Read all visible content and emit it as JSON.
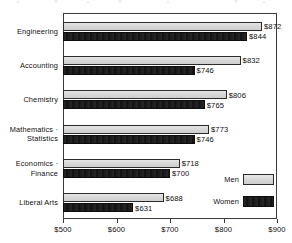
{
  "chart_data": {
    "type": "bar",
    "orientation": "horizontal",
    "title": "",
    "subtitle": "",
    "xlabel": "",
    "ylabel": "",
    "xlim": [
      500,
      900
    ],
    "xticks": [
      500,
      600,
      700,
      800,
      900
    ],
    "xtick_labels": [
      "$500",
      "$600",
      "$700",
      "$800",
      "$900"
    ],
    "grid": false,
    "legend_position": "inside-bottom-right",
    "categories": [
      "Engineering",
      "Accounting",
      "Chemistry",
      "Mathematics ·\nStatistics",
      "Economics ·\nFinance",
      "Liberal Arts"
    ],
    "series": [
      {
        "name": "Men",
        "color": "#d7d7d7",
        "values": [
          872,
          832,
          806,
          773,
          718,
          688
        ],
        "value_labels": [
          "$872",
          "$832",
          "$806",
          "$773",
          "$718",
          "$688"
        ]
      },
      {
        "name": "Women",
        "color": "#161616",
        "values": [
          844,
          746,
          765,
          746,
          700,
          631
        ],
        "value_labels": [
          "$844",
          "$746",
          "$765",
          "$746",
          "$700",
          "$631"
        ]
      }
    ]
  },
  "legend": {
    "entries": [
      {
        "label": "Men",
        "swatch": "men"
      },
      {
        "label": "Women",
        "swatch": "women"
      }
    ]
  }
}
